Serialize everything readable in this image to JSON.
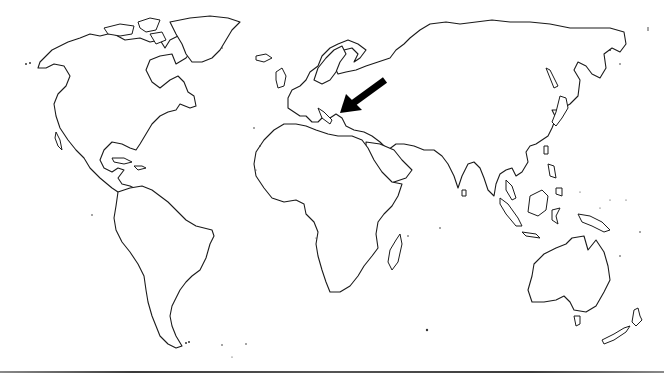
{
  "map": {
    "type": "world-outline-map",
    "projection": "equirectangular-like",
    "style": "black coastline outline on white",
    "colors": {
      "background": "#ffffff",
      "coastline": "#1a1a1a",
      "arrow": "#000000",
      "bottom_rule": "#4a4a4a"
    },
    "continents": [
      "North America",
      "South America",
      "Europe",
      "Africa",
      "Asia",
      "Australia",
      "Greenland",
      "New Zealand"
    ],
    "annotation": {
      "type": "arrow",
      "icon": "arrow-pointer-icon",
      "direction": "pointing down-left",
      "target_region": "Greece / Balkan Peninsula",
      "tail": [
        385,
        80
      ],
      "tip": [
        340,
        112
      ]
    }
  }
}
